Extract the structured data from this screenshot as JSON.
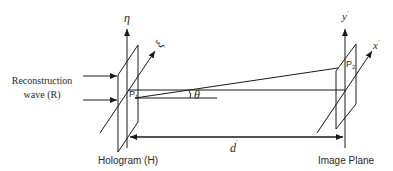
{
  "diagram": {
    "left_label": {
      "line1": "Reconstruction",
      "line2": "wave (R)"
    },
    "hologram": {
      "label": "Hologram (H)",
      "vertical_axis": "η",
      "oblique_axis": "ξ",
      "point": "P",
      "point_sub": "1"
    },
    "image_plane": {
      "label": "Image Plane",
      "vertical_axis": "y",
      "vertical_axis_prime": "'",
      "oblique_axis": "x",
      "oblique_axis_prime": "'",
      "point": "P",
      "point_sub": "2"
    },
    "angle_label": "θ",
    "distance_label": "d",
    "distance_prime": "'",
    "colors": {
      "line": "#1a1a1a",
      "text": "#2a2a2a",
      "background": "#ffffff"
    }
  }
}
